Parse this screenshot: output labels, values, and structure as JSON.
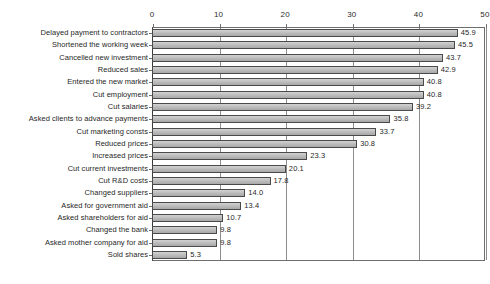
{
  "chart_data": {
    "type": "bar",
    "orientation": "horizontal",
    "title": "",
    "subtitle": "",
    "xlabel": "",
    "ylabel": "",
    "xlim": [
      0,
      50
    ],
    "xticks": [
      0,
      10,
      20,
      30,
      40,
      50
    ],
    "xtick_labels": [
      "0",
      "10",
      "20",
      "30",
      "40",
      "50"
    ],
    "grid": true,
    "grid_axis": "x",
    "legend": false,
    "legend_position": "none",
    "value_labels": true,
    "categories": [
      "Delayed payment to contractors",
      "Shortened the working week",
      "Cancelled new investment",
      "Reduced sales",
      "Entered the new market",
      "Cut employment",
      "Cut salaries",
      "Asked clients to advance payments",
      "Cut marketing consts",
      "Reduced prices",
      "Increased prices",
      "Cut current investments",
      "Cut R&D costs",
      "Changed suppliers",
      "Asked for government aid",
      "Asked shareholders for aid",
      "Changed the bank",
      "Asked mother company for aid",
      "Sold shares"
    ],
    "values": [
      45.9,
      45.5,
      43.7,
      42.9,
      40.8,
      40.8,
      39.2,
      35.8,
      33.7,
      30.8,
      23.3,
      20.1,
      17.8,
      14.0,
      13.4,
      10.7,
      9.8,
      9.8,
      5.3
    ],
    "value_label_text": [
      "45.9",
      "45.5",
      "43.7",
      "42.9",
      "40.8",
      "40.8",
      "39.2",
      "35.8",
      "33.7",
      "30.8",
      "23.3",
      "20.1",
      "17.8",
      "14.0",
      "13.4",
      "10.7",
      "9.8",
      "9.8",
      "5.3"
    ],
    "bar_color": "#c0c0c0",
    "bar_edge_color": "#4a4a4a",
    "grid_color": "#8d8d8d",
    "axis_color": "#6e6e6e",
    "text_color": "#1f1f1f",
    "background_color": "#ffffff"
  }
}
